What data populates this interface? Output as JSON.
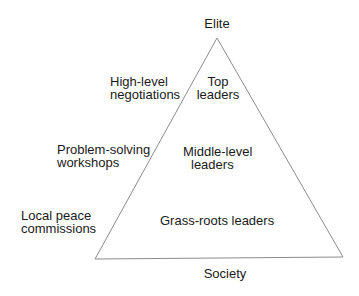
{
  "diagram": {
    "type": "pyramid",
    "apex_label": "Elite",
    "base_label": "Society",
    "line_color": "#8c8c8c",
    "text_color": "#1a1a1a",
    "levels": [
      {
        "inside": [
          "Top",
          "leaders"
        ],
        "approach": [
          "High-level",
          "negotiations"
        ]
      },
      {
        "inside": [
          "Middle-level",
          "leaders"
        ],
        "approach": [
          "Problem-solving",
          "workshops"
        ]
      },
      {
        "inside": [
          "Grass-roots leaders"
        ],
        "approach": [
          "Local peace",
          "commissions"
        ]
      }
    ]
  }
}
